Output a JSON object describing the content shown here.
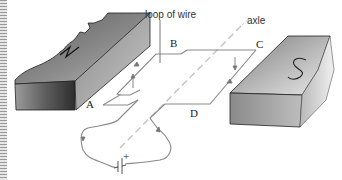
{
  "diagram": {
    "title_label": "loop of wire",
    "axle_label": "axle",
    "corners": {
      "a": "A",
      "b": "B",
      "c": "C",
      "d": "D"
    },
    "magnets": {
      "north": "N",
      "south": "S"
    },
    "battery": {
      "positive_label": "+"
    },
    "colors": {
      "wire": "#7a7a7a",
      "axle": "#c0c0c0",
      "magnet_dark": "#3e3e3e",
      "magnet_light": "#d0d0d0"
    }
  }
}
